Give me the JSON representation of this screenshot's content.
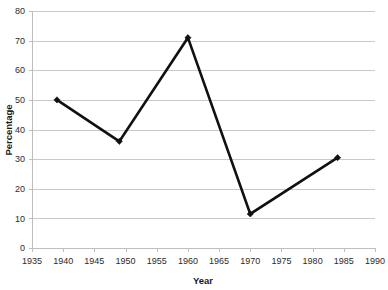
{
  "chart_data": {
    "type": "line",
    "title": "",
    "xlabel": "Year",
    "ylabel": "Percentage",
    "xlim": [
      1935,
      1990
    ],
    "ylim": [
      0,
      80
    ],
    "grid": "horizontal",
    "legend": "none",
    "x": [
      1939,
      1949,
      1960,
      1970,
      1984
    ],
    "values": [
      50,
      36,
      71,
      11.5,
      30.5
    ],
    "series": [
      {
        "name": "Percentage",
        "color": "#111111",
        "marker": "diamond",
        "points": [
          {
            "x": 1939,
            "y": 50
          },
          {
            "x": 1949,
            "y": 36
          },
          {
            "x": 1960,
            "y": 71
          },
          {
            "x": 1970,
            "y": 11.5
          },
          {
            "x": 1984,
            "y": 30.5
          }
        ]
      }
    ],
    "x_ticks": [
      1935,
      1940,
      1945,
      1950,
      1955,
      1960,
      1965,
      1970,
      1975,
      1980,
      1985,
      1990
    ],
    "x_tick_labels": [
      "1935",
      "1940",
      "1945",
      "1950",
      "1955",
      "1960",
      "1965",
      "1970",
      "1975",
      "1980",
      "1985",
      "1990"
    ],
    "y_ticks": [
      0,
      10,
      20,
      30,
      40,
      50,
      60,
      70,
      80
    ],
    "y_tick_labels": [
      "0",
      "10",
      "20",
      "30",
      "40",
      "50",
      "60",
      "70",
      "80"
    ],
    "colors": {
      "background": "#ffffff",
      "gridline": "#c9c9c9",
      "axis": "#bdbdbd",
      "series": "#111111",
      "text": "#2b2b2b"
    }
  }
}
